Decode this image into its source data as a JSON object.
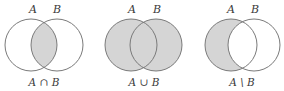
{
  "figure": {
    "colors": {
      "background": "#ffffff",
      "shade": "#d5d5d5",
      "outline": "#7a7a7a",
      "text": "#3a3a3a"
    },
    "panels": [
      {
        "id": "intersection",
        "set_a_label": "A",
        "set_b_label": "B",
        "operation_label": "A ∩ B",
        "shaded_region": "A and B overlap"
      },
      {
        "id": "union",
        "set_a_label": "A",
        "set_b_label": "B",
        "operation_label": "A ∪ B",
        "shaded_region": "all of A and B"
      },
      {
        "id": "difference",
        "set_a_label": "A",
        "set_b_label": "B",
        "operation_label": "A \\ B",
        "shaded_region": "A excluding B"
      }
    ]
  }
}
